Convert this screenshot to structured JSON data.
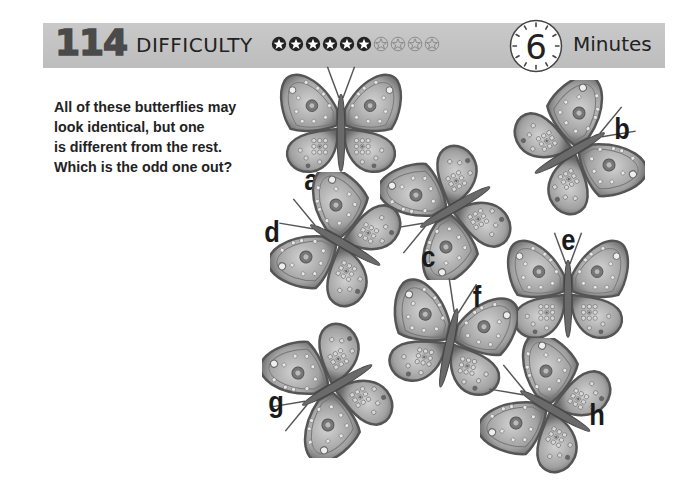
{
  "header": {
    "puzzle_number": "114",
    "difficulty_label": "DIFFICULTY",
    "difficulty_rating": 6,
    "difficulty_max": 10,
    "stars": [
      "filled",
      "filled",
      "filled",
      "filled",
      "filled",
      "filled",
      "empty",
      "empty",
      "empty",
      "empty"
    ],
    "time_value": "6",
    "time_unit": "Minutes"
  },
  "instructions": {
    "lines": [
      "All of these butterflies may",
      "look identical, but one",
      "is different from the rest.",
      "Which is the odd one out?"
    ]
  },
  "butterflies": [
    {
      "label": "a",
      "icon": "butterfly-icon"
    },
    {
      "label": "b",
      "icon": "butterfly-icon"
    },
    {
      "label": "c",
      "icon": "butterfly-icon"
    },
    {
      "label": "d",
      "icon": "butterfly-icon"
    },
    {
      "label": "e",
      "icon": "butterfly-icon"
    },
    {
      "label": "f",
      "icon": "butterfly-icon"
    },
    {
      "label": "g",
      "icon": "butterfly-icon"
    },
    {
      "label": "h",
      "icon": "butterfly-icon"
    }
  ],
  "colors": {
    "header_band": "#c4c4c4",
    "puzzle_number": "#4a4a4a",
    "text": "#222222",
    "wing_dark": "#5a5a5a",
    "wing_mid": "#9a9a9a",
    "wing_light": "#d0d0d0"
  }
}
